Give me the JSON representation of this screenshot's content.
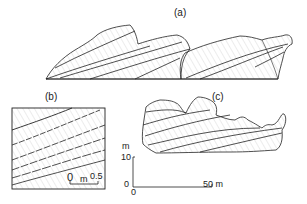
{
  "figure": {
    "panels": [
      {
        "id": "a",
        "label": "(a)",
        "description": "Large cross-bedded dune set, two adjoining bedforms with inclined foresets"
      },
      {
        "id": "b",
        "label": "(b)",
        "description": "Close-up box of inclined laminae"
      },
      {
        "id": "c",
        "label": "(c)",
        "description": "Elongated bedform section with low-angle cross-strata"
      }
    ],
    "scale_b": {
      "zero": "0",
      "unit": "m",
      "max": "0.5"
    },
    "scale_main": {
      "vertical_unit": "m",
      "vertical_max": "10",
      "vertical_zero": "0",
      "horizontal_zero": "0",
      "horizontal_max": "50 m"
    }
  },
  "colors": {
    "ink": "#222222",
    "hatch": "#9a9a9a",
    "background": "#ffffff"
  }
}
